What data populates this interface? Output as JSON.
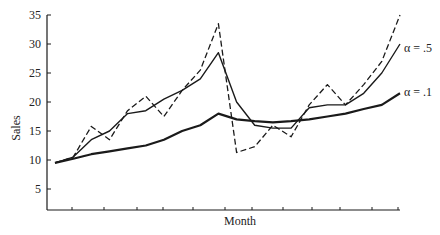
{
  "chart_data": {
    "type": "line",
    "title": "",
    "xlabel": "Month",
    "ylabel": "Sales",
    "ylim": [
      0,
      35
    ],
    "yticks": [
      5,
      10,
      15,
      20,
      25,
      30,
      35
    ],
    "x": [
      1,
      2,
      3,
      4,
      5,
      6,
      7,
      8,
      9,
      10,
      11,
      12,
      13,
      14,
      15,
      16,
      17,
      18,
      19,
      20
    ],
    "xtick_count": 12,
    "grid": false,
    "legend": "inline labels at right end of lines",
    "series": [
      {
        "name": "Actual sales",
        "style": "dashed",
        "values": [
          9.5,
          10.5,
          15.8,
          13.5,
          18.5,
          21,
          17.5,
          22,
          25.5,
          33.5,
          11.3,
          12.3,
          16,
          14,
          19.5,
          23,
          19.5,
          23,
          27,
          35
        ]
      },
      {
        "name": "α = .5",
        "style": "solid-thin",
        "values": [
          9.5,
          10.5,
          13.5,
          15,
          18,
          18.5,
          20.5,
          22,
          24,
          28.5,
          20,
          16,
          15.5,
          15.5,
          19,
          19.5,
          19.5,
          21.5,
          25,
          30
        ]
      },
      {
        "name": "α = .1",
        "style": "solid-thick",
        "values": [
          9.5,
          10.2,
          11,
          11.5,
          12,
          12.5,
          13.5,
          15,
          16,
          18,
          17,
          16.7,
          16.5,
          16.7,
          17,
          17.5,
          18,
          18.8,
          19.5,
          21.5
        ]
      }
    ]
  },
  "labels": {
    "xlabel": "Month",
    "ylabel": "Sales",
    "alpha_half": "α = .5",
    "alpha_tenth": "α = .1"
  },
  "colors": {
    "ink": "#1a1a1a",
    "background": "#ffffff"
  }
}
